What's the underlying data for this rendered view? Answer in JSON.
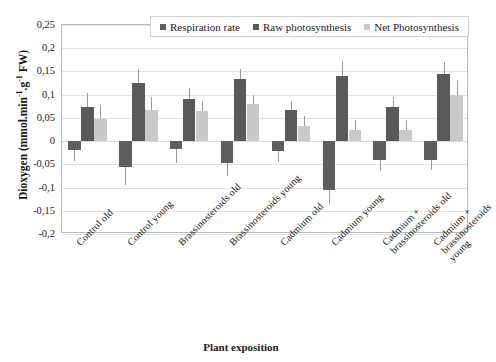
{
  "chart": {
    "title": "",
    "ylabel_text": "Dioxygen (mmol.min",
    "ylabel_sup1": "-1",
    "ylabel_mid": ".g",
    "ylabel_sup2": "-1",
    "ylabel_end": " FW)",
    "xlabel": "Plant exposition",
    "legend_position": "top-center"
  },
  "chart_data": {
    "type": "bar",
    "title": "",
    "xlabel": "Plant exposition",
    "ylabel": "Dioxygen (mmol.min-1.g-1 FW)",
    "ylim": [
      -0.2,
      0.25
    ],
    "yticks": [
      0.25,
      0.2,
      0.15,
      0.1,
      0.05,
      0,
      -0.05,
      -0.1,
      -0.15,
      -0.2
    ],
    "ytick_labels": [
      "0,25",
      "0,2",
      "0,15",
      "0,1",
      "0,05",
      "0",
      "-0,05",
      "-0,1",
      "-0,15",
      "-0,2"
    ],
    "grid": true,
    "decimal_separator": ",",
    "categories": [
      "Control old",
      "Control young",
      "Brassinosteroids old",
      "Brassinosteroids young",
      "Cadmium old",
      "Cadmium young",
      "Cadmium +\nbrassinosteroids old",
      "Cadmium +\nbrassinosteroids young"
    ],
    "series": [
      {
        "name": "Respiration rate",
        "color": "#5e5e5e",
        "values": [
          -0.02,
          -0.055,
          -0.018,
          -0.048,
          -0.022,
          -0.105,
          -0.04,
          -0.04
        ],
        "errors": [
          0.022,
          0.04,
          0.03,
          0.028,
          0.022,
          0.03,
          0.025,
          0.022
        ]
      },
      {
        "name": "Raw photosynthesis",
        "color": "#595959",
        "values": [
          0.073,
          0.125,
          0.09,
          0.133,
          0.066,
          0.14,
          0.073,
          0.145
        ],
        "errors": [
          0.03,
          0.03,
          0.025,
          0.023,
          0.02,
          0.033,
          0.022,
          0.025
        ]
      },
      {
        "name": "Net Photosynthesis",
        "color": "#c9c9c9",
        "values": [
          0.047,
          0.068,
          0.065,
          0.079,
          0.033,
          0.023,
          0.023,
          0.1
        ],
        "errors": [
          0.03,
          0.028,
          0.022,
          0.02,
          0.02,
          0.022,
          0.022,
          0.032
        ]
      }
    ]
  },
  "legend": {
    "items": [
      {
        "label": "Respiration rate",
        "color": "#5e5e5e"
      },
      {
        "label": "Raw photosynthesis",
        "color": "#595959"
      },
      {
        "label": "Net Photosynthesis",
        "color": "#c9c9c9"
      }
    ]
  }
}
